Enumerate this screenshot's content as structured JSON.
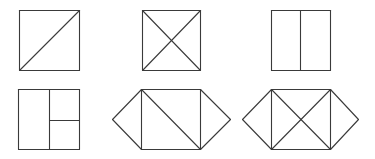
{
  "diagram": {
    "line_color": "#3a3a3a",
    "background": "#ffffff",
    "figures": [
      {
        "name": "square-one-diagonal",
        "segments": [
          [
            19,
            10,
            79,
            10
          ],
          [
            79,
            10,
            79,
            70
          ],
          [
            79,
            70,
            19,
            70
          ],
          [
            19,
            70,
            19,
            10
          ],
          [
            19,
            70,
            79,
            10
          ]
        ]
      },
      {
        "name": "square-two-diagonals",
        "segments": [
          [
            142,
            10,
            200,
            10
          ],
          [
            200,
            10,
            200,
            70
          ],
          [
            200,
            70,
            142,
            70
          ],
          [
            142,
            70,
            142,
            10
          ],
          [
            142,
            10,
            200,
            70
          ],
          [
            142,
            70,
            200,
            10
          ]
        ]
      },
      {
        "name": "square-vertical-split",
        "segments": [
          [
            271,
            10,
            330,
            10
          ],
          [
            330,
            10,
            330,
            70
          ],
          [
            330,
            70,
            271,
            70
          ],
          [
            271,
            70,
            271,
            10
          ],
          [
            300,
            10,
            300,
            70
          ]
        ]
      },
      {
        "name": "square-split-three",
        "segments": [
          [
            18,
            89,
            79,
            89
          ],
          [
            79,
            89,
            79,
            149
          ],
          [
            79,
            149,
            18,
            149
          ],
          [
            18,
            149,
            18,
            89
          ],
          [
            49,
            89,
            49,
            149
          ],
          [
            49,
            120,
            79,
            120
          ]
        ]
      },
      {
        "name": "hexagon-one-diagonal",
        "segments": [
          [
            141,
            89,
            200,
            89
          ],
          [
            200,
            89,
            200,
            149
          ],
          [
            200,
            149,
            141,
            149
          ],
          [
            141,
            149,
            141,
            89
          ],
          [
            141,
            89,
            200,
            149
          ],
          [
            141,
            89,
            112,
            119
          ],
          [
            112,
            119,
            141,
            149
          ],
          [
            200,
            89,
            230,
            119
          ],
          [
            230,
            119,
            200,
            149
          ]
        ]
      },
      {
        "name": "hexagon-two-diagonals",
        "segments": [
          [
            271,
            89,
            330,
            89
          ],
          [
            330,
            89,
            330,
            149
          ],
          [
            330,
            149,
            271,
            149
          ],
          [
            271,
            149,
            271,
            89
          ],
          [
            271,
            89,
            330,
            149
          ],
          [
            271,
            149,
            330,
            89
          ],
          [
            271,
            89,
            242,
            119
          ],
          [
            242,
            119,
            271,
            149
          ],
          [
            330,
            89,
            358,
            119
          ],
          [
            358,
            119,
            330,
            149
          ]
        ]
      }
    ]
  }
}
